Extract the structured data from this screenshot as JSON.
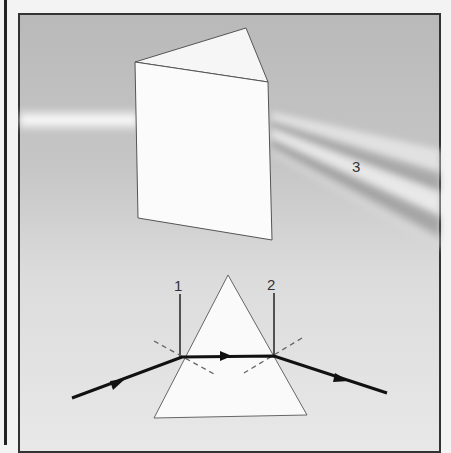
{
  "figure": {
    "labels": {
      "normal_1": "1",
      "normal_2": "2",
      "spectrum": "3"
    }
  }
}
